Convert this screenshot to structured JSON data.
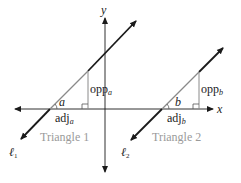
{
  "diagram": {
    "axes": {
      "x_label": "x",
      "y_label": "y"
    },
    "lines": [
      {
        "label_main": "ℓ",
        "label_sub": "1"
      },
      {
        "label_main": "ℓ",
        "label_sub": "2"
      }
    ],
    "triangles": [
      {
        "name": "Triangle 1",
        "angle": "a",
        "opp_main": "opp",
        "opp_sub": "a",
        "adj_main": "adj",
        "adj_sub": "a"
      },
      {
        "name": "Triangle 2",
        "angle": "b",
        "opp_main": "opp",
        "opp_sub": "b",
        "adj_main": "adj",
        "adj_sub": "b"
      }
    ],
    "colors": {
      "line": "#1a1a1a",
      "triangle_edge": "#8a8a8a",
      "triangle_label": "#9a9a9a"
    }
  }
}
